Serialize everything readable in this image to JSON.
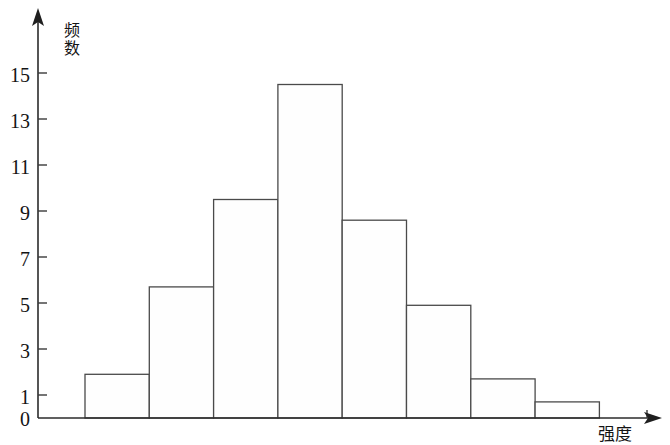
{
  "chart_data": {
    "type": "bar",
    "title": "",
    "subtitle": "",
    "xlabel": "强度",
    "ylabel": "频数",
    "categories": [
      "1",
      "2",
      "3",
      "4",
      "5",
      "6",
      "7",
      "8"
    ],
    "values": [
      1.9,
      5.7,
      9.5,
      14.5,
      8.6,
      4.9,
      1.7,
      0.7
    ],
    "series": [
      {
        "name": "频数",
        "values": [
          1.9,
          5.7,
          9.5,
          14.5,
          8.6,
          4.9,
          1.7,
          0.7
        ]
      }
    ],
    "ylim": [
      0,
      16
    ],
    "xlim": [
      0,
      8
    ],
    "y_ticks": [
      0,
      1,
      3,
      5,
      7,
      9,
      11,
      13,
      15
    ],
    "y_tick_labels": [
      "0",
      "1",
      "3",
      "5",
      "7",
      "9",
      "11",
      "13",
      "15"
    ],
    "x_tick_labels": [],
    "grid": false,
    "legend": false,
    "legend_position": "none",
    "bar_fill_color": "#ffffff",
    "bar_edge_color": "#4a4a4a",
    "axis_color": "#2b2b2b",
    "annotations": []
  },
  "axes": {
    "y_axis_title": "频数",
    "x_axis_title": "强度",
    "y_labels": [
      "15",
      "13",
      "11",
      "9",
      "7",
      "5",
      "3",
      "1",
      "0"
    ]
  },
  "icons": {
    "x_arrow": "arrow-right-icon",
    "y_arrow": "arrow-up-icon"
  }
}
